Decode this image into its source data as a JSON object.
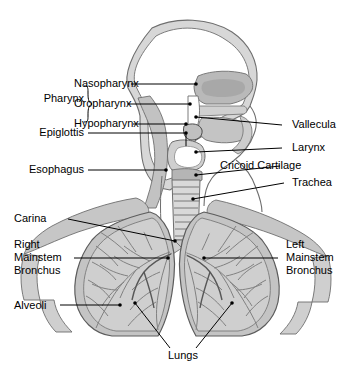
{
  "figure": {
    "background_color": "#ffffff",
    "line_color": "#000000",
    "outline_color": "#6e6e6e",
    "fill_light": "#ffffff",
    "fill_mid": "#c9c9c9",
    "fill_dark": "#9a9a9a",
    "vessel_color": "#8a8a8a"
  },
  "labels": {
    "group_pharynx": "Pharynx",
    "nasopharynx": "Nasopharynx",
    "oropharynx": "Oropharynx",
    "hypopharynx": "Hypopharynx",
    "epiglottis": "Epiglottis",
    "esophagus": "Esophagus",
    "vallecula": "Vallecula",
    "larynx": "Larynx",
    "cricoid_cartilage": "Cricoid Cartilage",
    "trachea": "Trachea",
    "carina": "Carina",
    "right_mainstem_bronchus_line1": "Right",
    "right_mainstem_bronchus_line2": "Mainstem",
    "right_mainstem_bronchus_line3": "Bronchus",
    "left_mainstem_bronchus_line1": "Left",
    "left_mainstem_bronchus_line2": "Mainstem",
    "left_mainstem_bronchus_line3": "Bronchus",
    "alveoli": "Alveoli",
    "lungs": "Lungs"
  }
}
